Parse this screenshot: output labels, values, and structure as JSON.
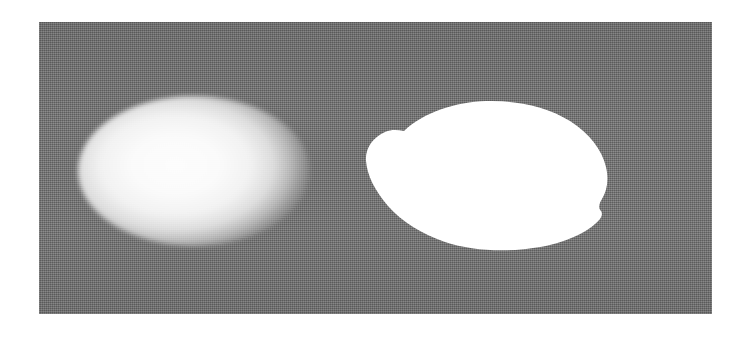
{
  "figure": {
    "domain": "paper-figure",
    "caption": "",
    "background_color": "#ffffff",
    "panel": {
      "name": "grayscale-image-panel",
      "background_color": "#737373",
      "texture": "dithered-halftone-noise",
      "x": 39,
      "y": 22,
      "width": 673,
      "height": 292
    },
    "objects": [
      {
        "id": "object-shaded",
        "label": "shaded-ellipsoid",
        "description": "smooth bright ellipsoid with soft shaded edges",
        "fill": "#fdfdfd",
        "edge": "soft-gradient",
        "center_x": 194,
        "center_y": 171,
        "radius_x": 116,
        "radius_y": 75,
        "highlight_x_pct": 42,
        "highlight_y_pct": 46
      },
      {
        "id": "object-mask",
        "label": "binary-segmentation-mask",
        "description": "solid white irregular blob with sharp boundary",
        "fill": "#ffffff",
        "edge": "sharp-irregular",
        "center_x": 497,
        "center_y": 175,
        "radius_x": 121,
        "radius_y": 63
      }
    ]
  },
  "colors": {
    "page": "#ffffff",
    "panel_gray": "#737373",
    "object_white": "#ffffff",
    "object_highlight": "#fdfdfd"
  }
}
